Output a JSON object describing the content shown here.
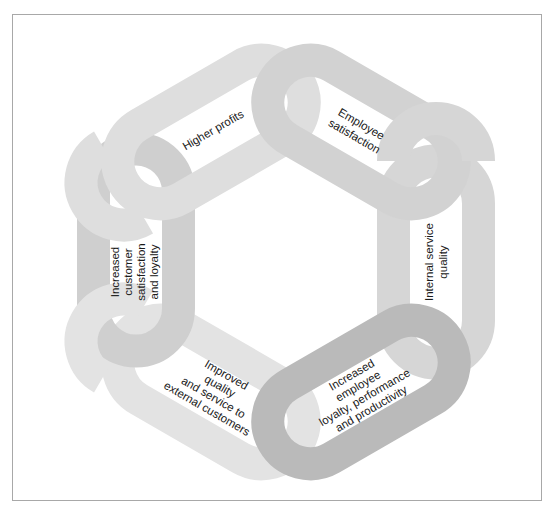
{
  "diagram": {
    "type": "service-profit chain",
    "colors": {
      "frame": "#a8a8a8",
      "background": "#ffffff",
      "text": "#1a1a1a"
    },
    "links": [
      {
        "id": "higher-profits",
        "lines": [
          "Higher profits"
        ],
        "color": "#dedede"
      },
      {
        "id": "employee-satisfaction",
        "lines": [
          "Employee",
          "satisfaction"
        ],
        "color": "#d2d2d2"
      },
      {
        "id": "internal-service-quality",
        "lines": [
          "Internal service",
          "quality"
        ],
        "color": "#d6d6d6"
      },
      {
        "id": "increased-employee-loyalty",
        "lines": [
          "Increased",
          "employee",
          "loyalty, performance",
          "and productivity"
        ],
        "color": "#bababa"
      },
      {
        "id": "improved-quality",
        "lines": [
          "Improved",
          "quality",
          "and service to",
          "external customers"
        ],
        "color": "#e3e3e3"
      },
      {
        "id": "increased-customer-satisfaction",
        "lines": [
          "Increased",
          "customer",
          "satisfaction",
          "and loyalty"
        ],
        "color": "#cfcfcf"
      }
    ]
  }
}
